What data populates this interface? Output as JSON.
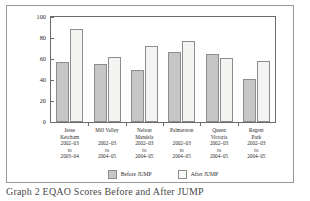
{
  "chart_data": {
    "type": "bar",
    "title": "",
    "xlabel": "",
    "ylabel": "",
    "ylim": [
      0,
      100
    ],
    "yticks": [
      0,
      20,
      40,
      60,
      80,
      100
    ],
    "grid": false,
    "legend_position": "bottom",
    "categories": [
      "Jesse Ketcham 2002-03 to 2003-04",
      "Mill Valley 2002-03 to 2004-05",
      "Nelson Mandela 2002-03 to 2004-05",
      "Palmerston 2002-03 to 2004-05",
      "Queen Victoria 2002-03 to 2004-05",
      "Regent Park 2002-03 to 2004-05"
    ],
    "category_lines": [
      [
        "Jesse",
        "Ketcham",
        "2002–03",
        "to",
        "2003–04"
      ],
      [
        "Mill Valley",
        "",
        "2002–03",
        "to",
        "2004–05"
      ],
      [
        "Nelson",
        "Mandela",
        "2002–03",
        "to",
        "2004–05"
      ],
      [
        "Palmerston",
        "",
        "2002–03",
        "to",
        "2004–05"
      ],
      [
        "Queen",
        "Victoria",
        "2002–03",
        "to",
        "2004–05"
      ],
      [
        "Regent",
        "Park",
        "2002–03",
        "to",
        "2004–05"
      ]
    ],
    "series": [
      {
        "name": "Before JUMP",
        "color": "#c6c6c6",
        "values": [
          57,
          55,
          50,
          67,
          65,
          41
        ]
      },
      {
        "name": "After JUMP",
        "color": "#f4f4f2",
        "values": [
          89,
          62,
          72,
          77,
          61,
          58
        ]
      }
    ]
  },
  "legend": {
    "items": [
      {
        "label": "Before JUMP"
      },
      {
        "label": "After JUMP"
      }
    ]
  },
  "caption": {
    "text": "Graph 2 EQAO Scores Before and After JUMP"
  }
}
